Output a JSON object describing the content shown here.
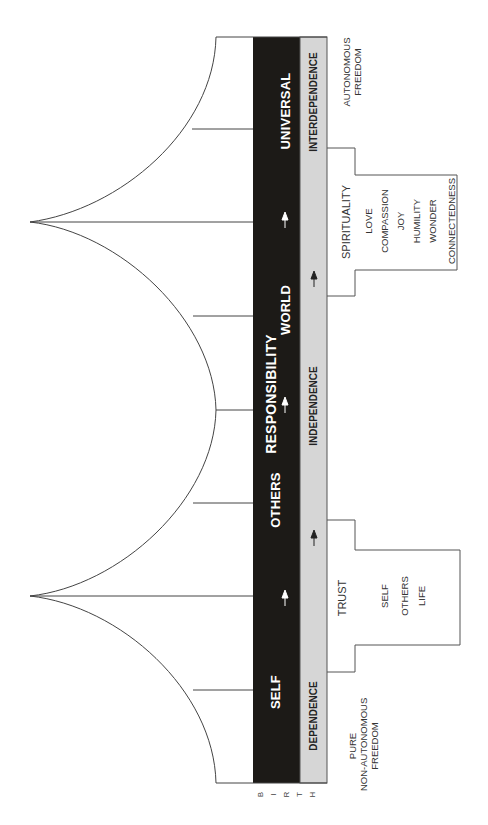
{
  "diagram": {
    "orientation": "rotated-90-ccw",
    "colors": {
      "black_band": "#1c1a17",
      "gray_band": "#d6d6d6",
      "line": "#444444",
      "band_text": "#ffffff"
    },
    "black_band": {
      "labels": {
        "self": "SELF",
        "others": "OTHERS",
        "responsibility": "RESPONSIBILITY",
        "world": "WORLD",
        "universal": "UNIVERSAL"
      }
    },
    "gray_band": {
      "labels": {
        "dependence": "DEPENDENCE",
        "independence": "INDEPENDENCE",
        "interdependence": "INTERDEPENDENCE"
      }
    },
    "start_label": [
      "B",
      "I",
      "R",
      "T",
      "H"
    ],
    "notes": {
      "start_freedom": [
        "PURE",
        "NON-AUTONOMOUS",
        "FREEDOM"
      ],
      "end_freedom": [
        "AUTONOMOUS",
        "FREEDOM"
      ]
    },
    "trust_box": {
      "title": "TRUST",
      "items": [
        "SELF",
        "OTHERS",
        "LIFE"
      ]
    },
    "spirituality_box": {
      "title": "SPIRITUALITY",
      "items": [
        "LOVE",
        "COMPASSION",
        "JOY",
        "HUMILITY",
        "WONDER",
        "CONNECTEDNESS"
      ]
    },
    "arrow_icon": "arrow-up-icon"
  }
}
